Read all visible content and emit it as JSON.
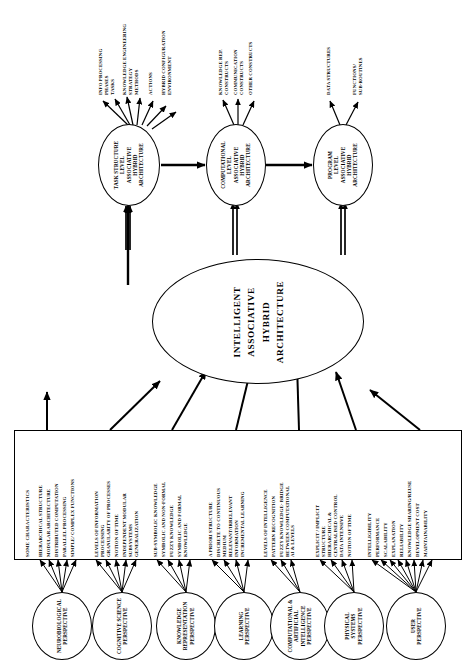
{
  "diagram": {
    "title": "Intelligent Associative Hybrid Architecture",
    "orientation": "rotated-90"
  },
  "center_node": {
    "name": "intelligent-associative-hybrid-architecture",
    "lines": [
      "INTELLIGENT",
      "ASSOCIATIVE",
      "HYBRID",
      "ARCHITECTURE"
    ]
  },
  "level_nodes": [
    {
      "name": "task-structure-level",
      "lines": [
        "TASK STRUCTURE",
        "LEVEL",
        "ASSOCIATIVE",
        "HYBRID",
        "ARCHITECTURE"
      ]
    },
    {
      "name": "computational-level",
      "lines": [
        "COMPUTATIONAL",
        "LEVEL",
        "ASSOCIATIVE",
        "HYBRID",
        "ARCHITECTURE"
      ]
    },
    {
      "name": "program-level",
      "lines": [
        "PROGRAM",
        "LEVEL",
        "ASSOCIATIVE",
        "HYBRID",
        "ARCHITECTURE"
      ]
    }
  ],
  "top_outputs": {
    "task_structure": [
      {
        "lines": [
          "INFO PROCESSING",
          "PHASES"
        ]
      },
      {
        "lines": [
          "TASKS"
        ]
      },
      {
        "lines": [
          "KNOWLEDGE ENGINEERING",
          "STRATEGY"
        ]
      },
      {
        "lines": [
          "METHODS"
        ]
      },
      {
        "lines": [
          "ACTIONS"
        ]
      },
      {
        "lines": [
          "HYBRID CONFIGURATION",
          "ENVIRONMENT"
        ]
      }
    ],
    "computational": [
      {
        "lines": [
          "KNOWLEDGE REP.",
          "CONSTRUCTS"
        ]
      },
      {
        "lines": [
          "COMMUNICATION",
          "CONSTRUCTS"
        ]
      },
      {
        "lines": [
          "OTHER CONSTRUCTS"
        ]
      }
    ],
    "program": [
      {
        "lines": [
          "DATA STRUCTURES"
        ]
      },
      {
        "lines": [
          "FUNCTIONS/",
          "SUB-ROUTINES"
        ]
      }
    ]
  },
  "characteristics": {
    "header": "SOME CHARACTERISTICS",
    "groups": [
      {
        "perspective": "neurobiological",
        "items": [
          {
            "lines": [
              "HIERARCHICAL  STRUCTURE"
            ]
          },
          {
            "lines": [
              "MODULAR ARCHITECTURE"
            ]
          },
          {
            "lines": [
              "DISTRIBUTED COMPUTATION"
            ]
          },
          {
            "lines": [
              "PARALLEL PROCESSING"
            ]
          },
          {
            "lines": [
              "SIMPLE/ COMPLEX FUNCTIONS"
            ]
          }
        ]
      },
      {
        "perspective": "cognitive-science",
        "items": [
          {
            "lines": [
              "LEVELS OF INFORMATION",
              "PROCESSING"
            ]
          },
          {
            "lines": [
              "GRANULARITY OF PROCESSES"
            ]
          },
          {
            "lines": [
              "NOTION OF TIME"
            ]
          },
          {
            "lines": [
              "INDEPENDENT MODULAR",
              "SUBSYSTEMS"
            ]
          },
          {
            "lines": [
              "GENERALIZATION"
            ]
          }
        ]
      },
      {
        "perspective": "knowledge-representation",
        "items": [
          {
            "lines": [
              "SUB-SYMBOLIC KNOWLEDGE"
            ]
          },
          {
            "lines": [
              "SYMBOLIC AND  NON-FORMAL"
            ]
          },
          {
            "lines": [
              "FUZZY KNOWLEDGE"
            ]
          },
          {
            "lines": [
              "SYMBOLIC AND FORMAL",
              "KNOWLEDGE"
            ]
          }
        ]
      },
      {
        "perspective": "learning",
        "items": [
          {
            "lines": [
              "A PRIORI STRUCTURE"
            ]
          },
          {
            "lines": [
              "DISCRETE TO CONTINUOUS",
              "MEDIUM"
            ]
          },
          {
            "lines": [
              "RELEVANT/IRRELEVANT",
              "INFORMATION"
            ]
          },
          {
            "lines": [
              "INCREMENTAL LEARNING"
            ]
          }
        ]
      },
      {
        "perspective": "computational-artificial-intelligence",
        "items": [
          {
            "lines": [
              "LEVELS OF INTELLIGENCE"
            ]
          },
          {
            "lines": [
              "PATTERN RECOGNITION"
            ]
          },
          {
            "lines": [
              "FUZZY KNOWLEDGE- BRIDGE",
              "BETWEEN COMPUTATIONAL",
              "AI & LEVELS"
            ]
          }
        ]
      },
      {
        "perspective": "physical-systems",
        "items": [
          {
            "lines": [
              "EXPLICIT / IMPLICIT",
              "STRUCTURE"
            ]
          },
          {
            "lines": [
              "HIERARCHICAL &",
              "CENTRALISED CONTROL"
            ]
          },
          {
            "lines": [
              "DATA INTENSIVE"
            ]
          },
          {
            "lines": [
              "NOTION OF TIME"
            ]
          }
        ]
      },
      {
        "perspective": "user",
        "items": [
          {
            "lines": [
              "INTELLIGIBILITY"
            ]
          },
          {
            "lines": [
              "PERFORMANCE"
            ]
          },
          {
            "lines": [
              "SCALABILITY"
            ]
          },
          {
            "lines": [
              "EXPLANATION"
            ]
          },
          {
            "lines": [
              "RELIABILITY"
            ]
          },
          {
            "lines": [
              "KNOWLEDGE SHARING/REUSE"
            ]
          },
          {
            "lines": [
              "DEVELOPMENT COST"
            ]
          },
          {
            "lines": [
              "MAINTAINABILITY"
            ]
          }
        ]
      }
    ]
  },
  "perspectives": [
    {
      "name": "neurobiological-perspective",
      "lines": [
        "NEUROBIOLOGICAL",
        "PERSPECTIVE"
      ]
    },
    {
      "name": "cognitive-science-perspective",
      "lines": [
        "COGNITIVE SCIENCE",
        "PERSPECTIVE"
      ]
    },
    {
      "name": "knowledge-representation-perspective",
      "lines": [
        "KNOWLEDGE",
        "REPRESENTATION",
        "PERSPECTIVE"
      ]
    },
    {
      "name": "learning-perspective",
      "lines": [
        "LEARNING",
        "PERSPECTIVE"
      ]
    },
    {
      "name": "computational-ai-perspective",
      "lines": [
        "COMPUTATIONAL &",
        "ARTIFICIAL",
        "INTELLIGENCE",
        "PERSPECTIVE"
      ]
    },
    {
      "name": "physical-systems-perspective",
      "lines": [
        "PHYSICAL",
        "SYSTEMS",
        "PERSPECTIVE"
      ]
    },
    {
      "name": "user-perspective",
      "lines": [
        "USER",
        "PERSPECTIVE"
      ]
    }
  ],
  "colors": {
    "stroke": "#000000",
    "background": "#ffffff"
  }
}
